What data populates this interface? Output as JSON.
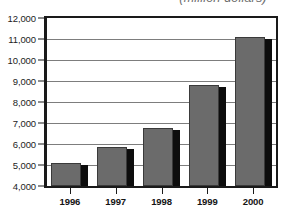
{
  "chart_data": {
    "type": "bar",
    "title": "(million dollars)",
    "xlabel": "",
    "ylabel": "",
    "categories": [
      "1996",
      "1997",
      "1998",
      "1999",
      "2000"
    ],
    "values": [
      5080,
      5850,
      6750,
      8800,
      11080
    ],
    "series": [
      {
        "name": "Amount",
        "values": [
          5080,
          5850,
          6750,
          8800,
          11080
        ]
      }
    ],
    "ylim": [
      4000,
      12000
    ],
    "ytick_labels": [
      "4,000",
      "5,000",
      "6,000",
      "7,000",
      "8,000",
      "9,000",
      "10,000",
      "11,000",
      "12,000"
    ],
    "ytick_values": [
      4000,
      5000,
      6000,
      7000,
      8000,
      9000,
      10000,
      11000,
      12000
    ],
    "grid": true,
    "legend": false,
    "legend_position": "none",
    "colors": {
      "bar_fill": "#6b6b6b",
      "bar_outline": "#3a3a3a",
      "bar_shadow": "#0d0d0d",
      "gridline": "#7d7d7d",
      "axis": "#1a1a1a",
      "text": "#141414",
      "title": "#6e6e6e",
      "background": "#ffffff"
    }
  }
}
